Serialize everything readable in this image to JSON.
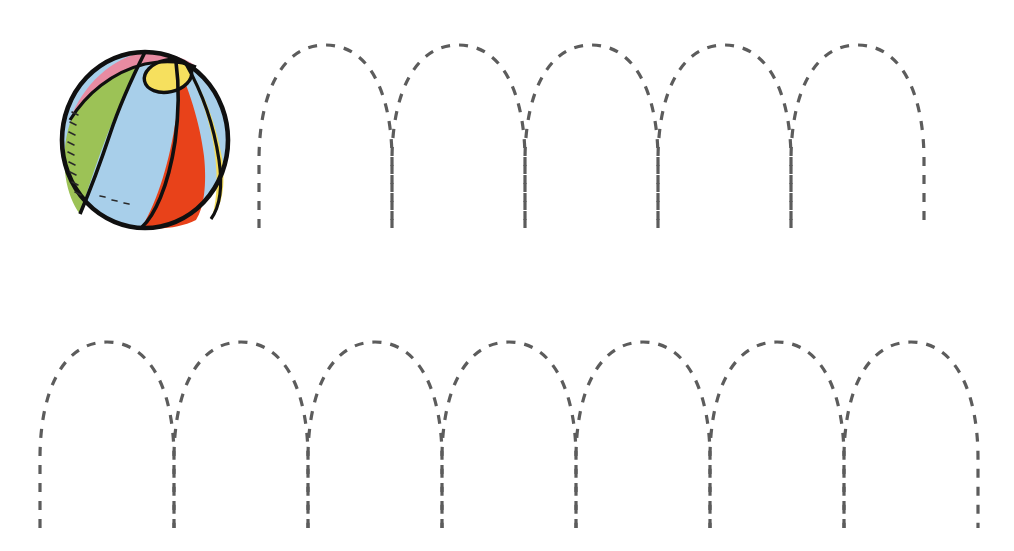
{
  "page": {
    "background_color": "#ffffff",
    "width": 1014,
    "height": 551
  },
  "illustration": {
    "name": "beach-ball",
    "label": "Beach ball",
    "bounds": {
      "cx": 145,
      "cy": 140,
      "rx": 83,
      "ry": 88
    },
    "outline_color": "#101010",
    "outline_width": 4.5,
    "segments": [
      {
        "name": "pink-segment",
        "color": "#e88ba2"
      },
      {
        "name": "green-segment",
        "color": "#9cc256"
      },
      {
        "name": "light-blue-segment",
        "color": "#a8cfea"
      },
      {
        "name": "red-segment",
        "color": "#e8421a"
      },
      {
        "name": "yellow-segment",
        "color": "#f4dd5a"
      },
      {
        "name": "yellow-cap",
        "color": "#f6e05e"
      }
    ]
  },
  "trace": {
    "stroke_color": "#5c5c5c",
    "stroke_width": 3.2,
    "dash_pattern": "9 9",
    "shape": "inverted-u-arch",
    "rows": [
      {
        "name": "trace-row-top",
        "label": "Top tracing row",
        "arch_count": 5,
        "start_x": 259,
        "arch_width": 133,
        "apex_y": 45,
        "baseline_y": 228,
        "shoulder_y": 160,
        "apex_half_width": 46
      },
      {
        "name": "trace-row-bottom",
        "label": "Bottom tracing row",
        "arch_count": 7,
        "start_x": 40,
        "arch_width": 134,
        "apex_y": 342,
        "baseline_y": 528,
        "shoulder_y": 458,
        "apex_half_width": 46
      }
    ]
  }
}
